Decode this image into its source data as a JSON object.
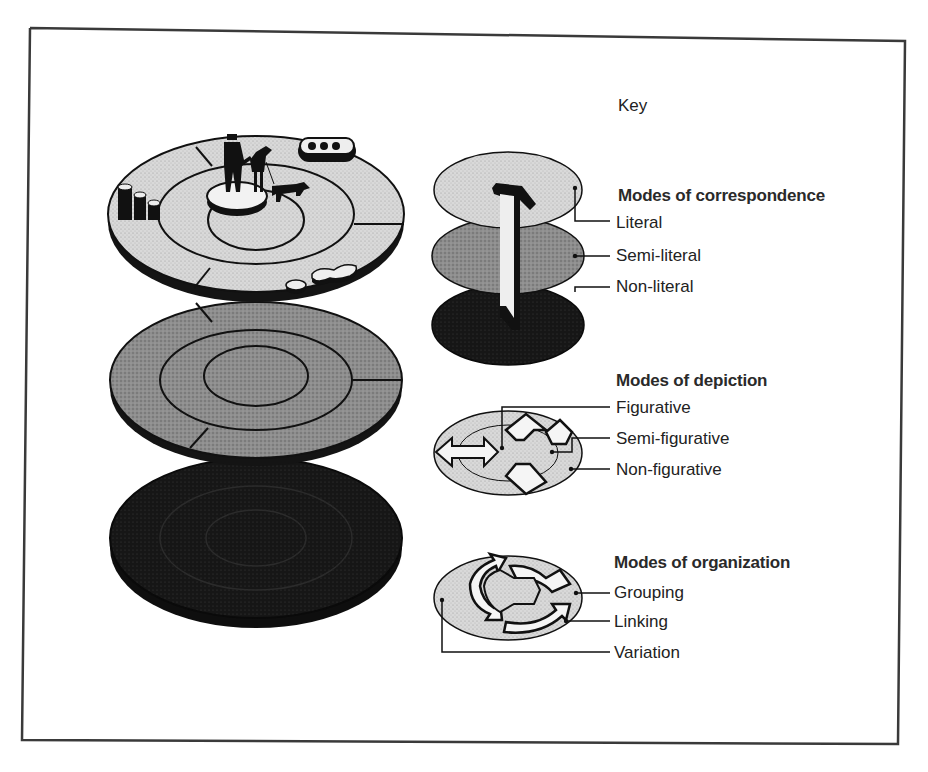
{
  "figure": {
    "key_title": "Key",
    "main_illustration": {
      "description": "Three stacked elliptical disks, each divided into concentric rings",
      "layers": [
        {
          "name": "top-disk",
          "shade": "light",
          "content": [
            "man figure",
            "woman figure",
            "dog figure",
            "three cylinders",
            "connected pill shapes"
          ]
        },
        {
          "name": "middle-disk",
          "shade": "medium"
        },
        {
          "name": "bottom-disk",
          "shade": "dark"
        }
      ]
    },
    "sections": [
      {
        "title": "Modes of correspondence",
        "items": [
          "Literal",
          "Semi-literal",
          "Non-literal"
        ]
      },
      {
        "title": "Modes of depiction",
        "items": [
          "Figurative",
          "Semi-figurative",
          "Non-figurative"
        ]
      },
      {
        "title": "Modes of organization",
        "items": [
          "Grouping",
          "Linking",
          "Variation"
        ]
      }
    ],
    "colors": {
      "frame": "#3a3a3a",
      "light_disk": "#d6d6d6",
      "medium_disk": "#8c8c8c",
      "dark_disk": "#1a1a1a",
      "outline": "#111111"
    }
  }
}
